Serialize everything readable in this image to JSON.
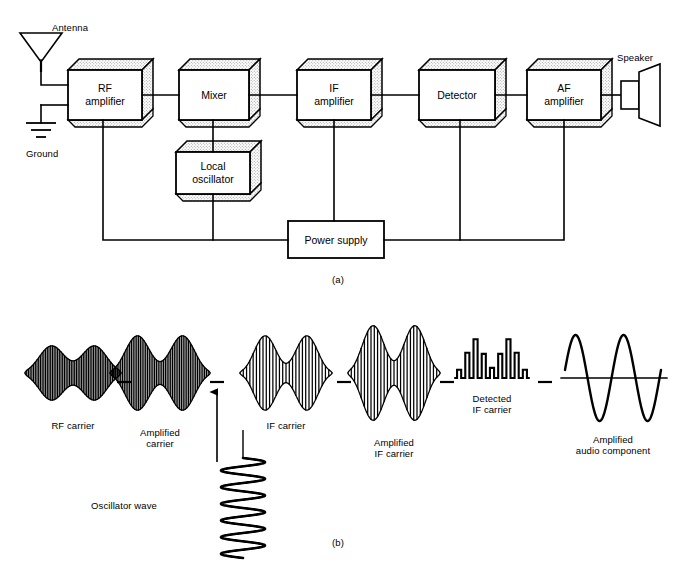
{
  "figure": {
    "panel_a_caption": "(a)",
    "panel_b_caption": "(b)",
    "stroke_color": "#000000",
    "shadow_fill": "#e8e8e8",
    "block_fill": "#ffffff"
  },
  "panel_a": {
    "blocks": [
      {
        "id": "rf-amplifier",
        "line1": "RF",
        "line2": "amplifier",
        "style": "3d",
        "x": 68,
        "y": 70,
        "w": 74,
        "h": 50
      },
      {
        "id": "mixer",
        "line1": "Mixer",
        "line2": "",
        "style": "3d",
        "x": 179,
        "y": 70,
        "w": 70,
        "h": 50
      },
      {
        "id": "if-amplifier",
        "line1": "IF",
        "line2": "amplifier",
        "style": "3d",
        "x": 297,
        "y": 70,
        "w": 74,
        "h": 50
      },
      {
        "id": "detector",
        "line1": "Detector",
        "line2": "",
        "style": "3d",
        "x": 419,
        "y": 70,
        "w": 76,
        "h": 50
      },
      {
        "id": "af-amplifier",
        "line1": "AF",
        "line2": "amplifier",
        "style": "3d",
        "x": 527,
        "y": 70,
        "w": 74,
        "h": 50
      },
      {
        "id": "local-oscillator",
        "line1": "Local",
        "line2": "oscillator",
        "style": "3d",
        "x": 176,
        "y": 152,
        "w": 74,
        "h": 42
      },
      {
        "id": "power-supply",
        "line1": "Power supply",
        "line2": "",
        "style": "flat",
        "x": 288,
        "y": 221,
        "w": 96,
        "h": 37
      }
    ],
    "symbols": [
      {
        "id": "antenna",
        "label": "Antenna",
        "label_x": 52,
        "label_y": 22
      },
      {
        "id": "ground",
        "label": "Ground",
        "label_x": 44,
        "label_y": 150
      },
      {
        "id": "speaker",
        "label": "Speaker",
        "label_x": 633,
        "label_y": 58
      }
    ]
  },
  "panel_b": {
    "waveforms": [
      {
        "id": "rf-carrier",
        "label": "RF carrier",
        "label_x": 73,
        "label_y": 420,
        "type": "am-envelope",
        "cx": 73,
        "cy": 373,
        "half_w": 48,
        "amp": 32,
        "cycles": 14,
        "env_lobes": 2,
        "env_min": 0.38
      },
      {
        "id": "amplified-carrier",
        "label": "Amplified\ncarrier",
        "label_x": 160,
        "label_y": 427,
        "type": "am-envelope",
        "cx": 160,
        "cy": 373,
        "half_w": 50,
        "amp": 44,
        "cycles": 14,
        "env_lobes": 2,
        "env_min": 0.26
      },
      {
        "id": "if-carrier",
        "label": "IF carrier",
        "label_x": 286,
        "label_y": 420,
        "type": "am-envelope",
        "cx": 286,
        "cy": 373,
        "half_w": 46,
        "amp": 44,
        "cycles": 7,
        "env_lobes": 2,
        "env_min": 0.22
      },
      {
        "id": "amplified-if-carrier",
        "label": "Amplified\nIF carrier",
        "label_x": 394,
        "label_y": 437,
        "type": "am-envelope",
        "cx": 394,
        "cy": 373,
        "half_w": 46,
        "amp": 56,
        "cycles": 7,
        "env_lobes": 2,
        "env_min": 0.22
      },
      {
        "id": "detected-if-carrier",
        "label": "Detected\nIF carrier",
        "label_x": 492,
        "label_y": 393,
        "type": "rectified",
        "cx": 492,
        "cy": 378,
        "half_w": 37,
        "amp": 46,
        "pulses": 9
      },
      {
        "id": "amplified-audio",
        "label": "Amplified\naudio component",
        "label_x": 613,
        "label_y": 434,
        "type": "audio-sine",
        "cx": 613,
        "cy": 378,
        "half_w": 48,
        "amp": 43,
        "cycles": 2
      },
      {
        "id": "oscillator-wave",
        "label": "Oscillator wave",
        "label_x": 124,
        "label_y": 500,
        "type": "vertical-sine",
        "cx": 243,
        "cy": 508,
        "half_h": 50,
        "amp": 22,
        "cycles": 6
      }
    ],
    "separators": [
      {
        "id": "sep-1",
        "x": 124,
        "y": 382
      },
      {
        "id": "sep-2",
        "x": 217,
        "y": 382
      },
      {
        "id": "sep-3",
        "x": 344,
        "y": 382
      },
      {
        "id": "sep-4",
        "x": 447,
        "y": 382
      },
      {
        "id": "sep-5",
        "x": 545,
        "y": 382
      }
    ],
    "oscillator_arrow": {
      "id": "oscillator-arrow",
      "x": 217,
      "y_from": 462,
      "y_to": 392
    }
  }
}
